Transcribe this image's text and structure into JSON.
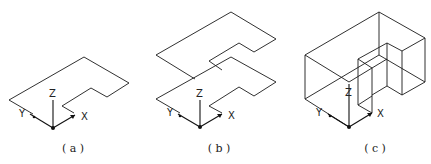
{
  "figure": {
    "panels": [
      {
        "id": "a",
        "caption": "( a )",
        "axes": {
          "x": "X",
          "y": "Y",
          "z": "Z"
        },
        "description": "Single planar L-shaped profile on XY plane"
      },
      {
        "id": "b",
        "caption": "( b )",
        "axes": {
          "x": "X",
          "y": "Y",
          "z": "Z"
        },
        "description": "Profile copied and translated along Z"
      },
      {
        "id": "c",
        "caption": "( c )",
        "axes": {
          "x": "X",
          "y": "Y",
          "z": "Z"
        },
        "description": "Extruded wireframe solid"
      }
    ],
    "colors": {
      "line": "#1a1a1a",
      "background": "#ffffff"
    }
  }
}
